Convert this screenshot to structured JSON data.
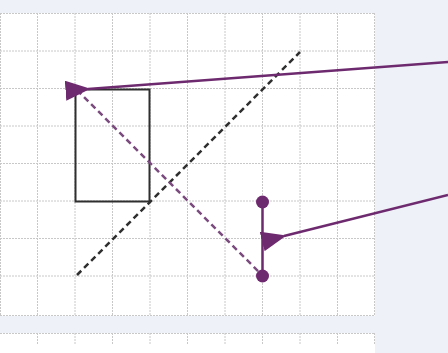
{
  "diagram": {
    "background": "#eef1f8",
    "grid": {
      "color": "#c8c8c8",
      "cell_size": 37.5,
      "columns": 10,
      "rows": 8,
      "x_lines": [
        0,
        37.5,
        75,
        112.5,
        150,
        187.5,
        225,
        262.5,
        300,
        337.5,
        375
      ],
      "y_lines": [
        13,
        50.5,
        88,
        125.5,
        163,
        200.5,
        238,
        275.5,
        313
      ]
    },
    "shapes": [
      {
        "type": "rectangle",
        "x": 75,
        "y": 89,
        "width": 75,
        "height": 113,
        "stroke": "#2f2f2f",
        "style": "solid"
      },
      {
        "type": "line",
        "x1": 76,
        "y1": 275,
        "x2": 300,
        "y2": 52,
        "stroke": "#2f2f2f",
        "style": "dashed"
      },
      {
        "type": "line",
        "x1": 76,
        "y1": 89,
        "x2": 262,
        "y2": 276,
        "stroke": "#7b4a7e",
        "style": "dashed"
      },
      {
        "type": "segment",
        "x1": 262,
        "y1": 202,
        "x2": 262,
        "y2": 276,
        "stroke": "#6e2a6e",
        "endpoints": "dots"
      }
    ],
    "arrows": [
      {
        "from": [
          448,
          62
        ],
        "to": [
          76,
          89
        ],
        "color": "#6e2a6e"
      },
      {
        "from": [
          448,
          196
        ],
        "to": [
          272,
          238
        ],
        "color": "#6e2a6e"
      }
    ],
    "accent_color": "#6e2a6e"
  }
}
